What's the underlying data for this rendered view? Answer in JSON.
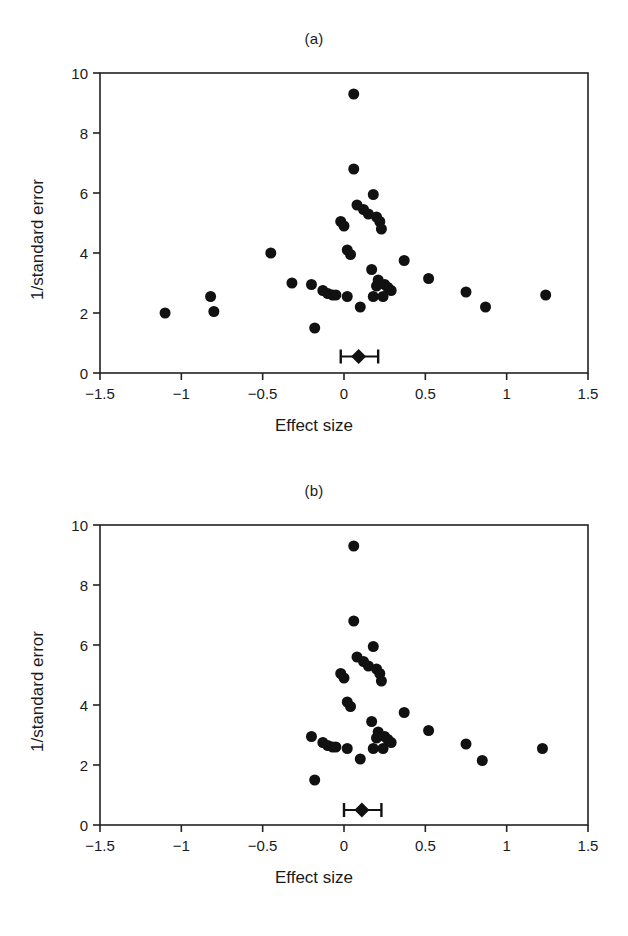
{
  "figure": {
    "caption_fragment": " "
  },
  "panels": [
    {
      "id": "a",
      "title": "(a)",
      "xlabel": "Effect size",
      "ylabel": "1/standard error"
    },
    {
      "id": "b",
      "title": "(b)",
      "xlabel": "Effect size",
      "ylabel": "1/standard error"
    }
  ],
  "axis": {
    "x_ticks": [
      "−1.5",
      "−1",
      "−0.5",
      "0",
      "0.5",
      "1",
      "1.5"
    ],
    "x_tick_values": [
      -1.5,
      -1,
      -0.5,
      0,
      0.5,
      1,
      1.5
    ],
    "y_ticks": [
      "0",
      "2",
      "4",
      "6",
      "8",
      "10"
    ],
    "y_tick_values": [
      0,
      2,
      4,
      6,
      8,
      10
    ]
  },
  "chart_data": [
    {
      "type": "scatter",
      "title": "(a)",
      "xlabel": "Effect size",
      "ylabel": "1/standard error",
      "xlim": [
        -1.5,
        1.5
      ],
      "ylim": [
        0,
        10
      ],
      "grid": false,
      "legend": "none",
      "marker": {
        "shape": "circle",
        "color": "#111111",
        "size": 11
      },
      "points": [
        {
          "x": 0.06,
          "y": 9.3
        },
        {
          "x": 0.06,
          "y": 6.8
        },
        {
          "x": 0.18,
          "y": 5.95
        },
        {
          "x": 0.08,
          "y": 5.6
        },
        {
          "x": 0.12,
          "y": 5.45
        },
        {
          "x": 0.15,
          "y": 5.3
        },
        {
          "x": 0.2,
          "y": 5.2
        },
        {
          "x": 0.22,
          "y": 5.05
        },
        {
          "x": -0.02,
          "y": 5.05
        },
        {
          "x": 0.0,
          "y": 4.9
        },
        {
          "x": 0.23,
          "y": 4.8
        },
        {
          "x": 0.02,
          "y": 4.1
        },
        {
          "x": 0.04,
          "y": 3.95
        },
        {
          "x": -0.45,
          "y": 4.0
        },
        {
          "x": 0.37,
          "y": 3.75
        },
        {
          "x": 0.17,
          "y": 3.45
        },
        {
          "x": 0.52,
          "y": 3.15
        },
        {
          "x": -0.32,
          "y": 3.0
        },
        {
          "x": -0.2,
          "y": 2.95
        },
        {
          "x": 0.21,
          "y": 3.1
        },
        {
          "x": 0.25,
          "y": 2.95
        },
        {
          "x": 0.2,
          "y": 2.9
        },
        {
          "x": 0.27,
          "y": 2.85
        },
        {
          "x": 0.29,
          "y": 2.75
        },
        {
          "x": -0.13,
          "y": 2.75
        },
        {
          "x": -0.1,
          "y": 2.65
        },
        {
          "x": -0.07,
          "y": 2.6
        },
        {
          "x": -0.05,
          "y": 2.6
        },
        {
          "x": 0.02,
          "y": 2.55
        },
        {
          "x": 0.18,
          "y": 2.55
        },
        {
          "x": 0.24,
          "y": 2.55
        },
        {
          "x": 0.75,
          "y": 2.7
        },
        {
          "x": 1.24,
          "y": 2.6
        },
        {
          "x": -0.82,
          "y": 2.55
        },
        {
          "x": -0.8,
          "y": 2.05
        },
        {
          "x": -1.1,
          "y": 2.0
        },
        {
          "x": 0.87,
          "y": 2.2
        },
        {
          "x": 0.1,
          "y": 2.2
        },
        {
          "x": -0.18,
          "y": 1.5
        }
      ],
      "summary": {
        "label": "pooled-effect",
        "x": 0.09,
        "y": 0.55,
        "ci_low": -0.02,
        "ci_high": 0.21,
        "marker": "diamond"
      }
    },
    {
      "type": "scatter",
      "title": "(b)",
      "xlabel": "Effect size",
      "ylabel": "1/standard error",
      "xlim": [
        -1.5,
        1.5
      ],
      "ylim": [
        0,
        10
      ],
      "grid": false,
      "legend": "none",
      "marker": {
        "shape": "circle",
        "color": "#111111",
        "size": 11
      },
      "points": [
        {
          "x": 0.06,
          "y": 9.3
        },
        {
          "x": 0.06,
          "y": 6.8
        },
        {
          "x": 0.18,
          "y": 5.95
        },
        {
          "x": 0.08,
          "y": 5.6
        },
        {
          "x": 0.12,
          "y": 5.45
        },
        {
          "x": 0.15,
          "y": 5.3
        },
        {
          "x": 0.2,
          "y": 5.2
        },
        {
          "x": 0.22,
          "y": 5.05
        },
        {
          "x": -0.02,
          "y": 5.05
        },
        {
          "x": 0.0,
          "y": 4.9
        },
        {
          "x": 0.23,
          "y": 4.8
        },
        {
          "x": 0.02,
          "y": 4.1
        },
        {
          "x": 0.04,
          "y": 3.95
        },
        {
          "x": 0.37,
          "y": 3.75
        },
        {
          "x": 0.17,
          "y": 3.45
        },
        {
          "x": 0.52,
          "y": 3.15
        },
        {
          "x": -0.2,
          "y": 2.95
        },
        {
          "x": 0.21,
          "y": 3.1
        },
        {
          "x": 0.25,
          "y": 2.95
        },
        {
          "x": 0.2,
          "y": 2.9
        },
        {
          "x": 0.27,
          "y": 2.85
        },
        {
          "x": 0.29,
          "y": 2.75
        },
        {
          "x": -0.13,
          "y": 2.75
        },
        {
          "x": -0.1,
          "y": 2.65
        },
        {
          "x": -0.07,
          "y": 2.6
        },
        {
          "x": -0.05,
          "y": 2.6
        },
        {
          "x": 0.02,
          "y": 2.55
        },
        {
          "x": 0.18,
          "y": 2.55
        },
        {
          "x": 0.24,
          "y": 2.55
        },
        {
          "x": 0.75,
          "y": 2.7
        },
        {
          "x": 1.22,
          "y": 2.55
        },
        {
          "x": 0.85,
          "y": 2.15
        },
        {
          "x": 0.1,
          "y": 2.2
        },
        {
          "x": -0.18,
          "y": 1.5
        }
      ],
      "summary": {
        "label": "pooled-effect",
        "x": 0.11,
        "y": 0.5,
        "ci_low": 0.0,
        "ci_high": 0.23,
        "marker": "diamond"
      }
    }
  ]
}
